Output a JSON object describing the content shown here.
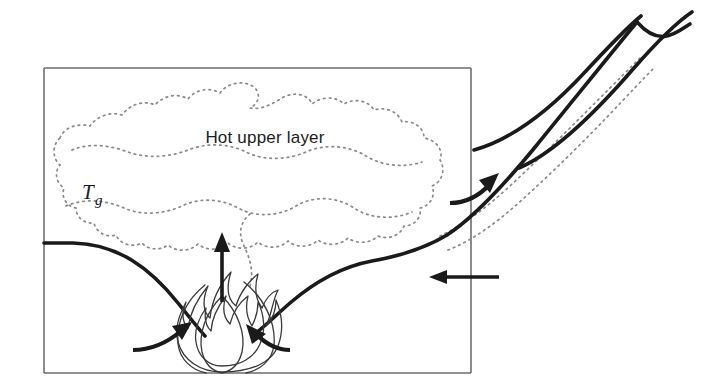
{
  "figure": {
    "background_color": "#ffffff",
    "width": 726,
    "height": 389
  },
  "labels": {
    "upper_layer": "Hot upper layer",
    "gas_temperature_symbol": "T",
    "gas_temperature_subscript": "g"
  },
  "colors": {
    "wall_stroke": "#6f6f6f",
    "interface_stroke": "#1a1a1a",
    "plume_stroke": "#1a1a1a",
    "smoke_boundary_stroke": "#8a8a8a",
    "flame_stroke": "#3a3a3a",
    "arrow_stroke": "#1a1a1a",
    "text_fill": "#1c1c1c"
  },
  "compartment": {
    "name": "compartment-enclosure",
    "left": 44,
    "top": 68,
    "right": 471,
    "bottom": 373,
    "wall_path": "M 44 68 L 471 68 M 471 68 L 471 373 M 471 373 L 44 373 M 44 373 L 44 68"
  },
  "layer_interface": {
    "left_branch_path": "M 44 243 L 73 243 C 118 244 150 268 178 303 C 190 318 198 328 205 336",
    "right_branch_path": "M 252 336 C 262 329 274 317 290 303 C 318 279 345 266 372 261 C 400 256 424 249 447 235 C 470 220 500 190 536 146 C 576 97 612 52 637 22"
  },
  "external_plume": {
    "upper_boundary_path": "M 474 150 C 510 140 548 112 585 72 C 612 43 630 25 641 16",
    "lower_boundary_path": "M 637 22 C 660 48 676 33 690 24",
    "outer_curve_path": "M 519 168 C 556 152 596 112 634 68 C 663 35 680 20 692 12"
  },
  "smoke_cloud": {
    "description": "dotted irregular boundary of hot smoke layer",
    "inner_path": "M 60 138 C 64 127 78 123 90 126 C 96 117 110 111 122 115 C 130 104 144 100 155 105 C 164 95 178 93 188 99 C 196 89 210 87 220 93 C 228 82 244 80 254 87 C 262 95 258 104 250 108 C 262 110 272 104 282 98 C 294 91 308 94 312 104 C 322 96 336 96 344 104 C 354 98 368 100 374 110 C 386 106 398 112 402 122 C 414 120 424 128 424 138 C 436 140 444 150 440 160 C 446 170 442 182 432 186 C 436 196 430 206 420 208 C 422 218 414 226 404 226 C 400 236 388 240 378 236 C 370 244 356 244 348 238 C 340 246 326 246 318 240 C 310 248 296 248 288 241 C 280 249 266 249 258 242 C 250 250 236 250 228 243 C 220 251 206 251 198 244 C 190 252 176 252 168 245 C 160 251 148 250 142 243 C 132 248 120 244 116 235 C 106 238 96 232 94 223 C 84 224 76 217 76 208 C 66 206 61 197 64 188 C 56 183 54 172 60 165 C 52 158 52 145 60 138 Z",
    "ripple_upper_path": "M 72 150 C 90 142 112 146 128 152 C 148 159 170 157 188 150 C 208 142 230 144 246 152 C 264 161 288 160 306 152 C 326 143 350 146 366 156 C 382 166 404 168 422 162",
    "ripple_lower_path": "M 66 206 C 84 198 106 200 124 208 C 142 216 164 214 182 206 C 200 197 222 199 238 208 C 256 218 280 216 296 206 C 314 195 338 197 354 208 C 370 219 394 220 412 212",
    "tail_path": "M 250 286 C 254 272 250 258 244 246 C 238 234 240 222 250 214",
    "vent_trail_upper_path": "M 440 236 C 462 226 486 208 510 186 C 540 158 570 128 596 102 C 616 82 632 66 642 56",
    "vent_trail_lower_path": "M 448 250 C 474 240 500 220 524 198 C 554 171 584 141 610 114 C 628 95 644 78 654 68"
  },
  "fire": {
    "name": "flame",
    "base_x": 222,
    "base_y": 373,
    "outer_flame_path": "M 222 372 C 200 372 183 360 178 342 C 174 327 180 314 186 302 C 182 312 182 322 188 328 C 190 312 198 298 208 286 C 202 300 203 312 210 318 C 212 300 220 284 231 272 C 226 288 228 300 236 306 C 240 292 250 280 258 274 C 254 288 256 300 262 308 C 266 298 272 292 278 290 C 272 302 272 314 266 326 C 272 320 276 310 276 300 C 282 314 284 330 278 346 C 272 362 252 372 222 372 Z",
    "inner_flame_path": "M 222 366 C 208 366 198 356 196 342 C 194 330 199 318 206 308 C 204 318 206 326 211 331 C 212 318 218 306 226 296 C 222 308 224 318 230 324 C 233 312 240 302 248 296 C 245 308 247 318 252 326 C 256 318 258 310 258 302 C 264 314 266 330 260 344 C 254 358 240 366 222 366 Z",
    "left_petal_path": "M 205 285 C 186 300 176 322 178 344 C 180 360 192 370 206 373",
    "right_petal_path": "M 244 282 C 264 298 276 322 274 345 C 272 361 260 370 246 373",
    "core_petal_path": "M 222 296 C 206 312 198 334 202 352 C 205 364 212 371 222 373 C 232 371 239 364 242 352 C 246 334 238 312 222 296 Z"
  },
  "arrows": [
    {
      "name": "plume-up-arrow",
      "kind": "straight-vertical",
      "direction": "up",
      "shaft_path": "M 222 302 L 222 244",
      "head_points": "222,232 214,252 230,252"
    },
    {
      "name": "air-inflow-left-arrow",
      "kind": "curved",
      "direction": "up-right",
      "shaft_path": "M 133 350 C 152 350 168 342 181 331",
      "head_points": "192,322 172,326 182,340"
    },
    {
      "name": "air-inflow-right-arrow",
      "kind": "curved",
      "direction": "up-left",
      "shaft_path": "M 290 350 C 278 350 266 344 256 334",
      "head_points": "246,324 252,344 266,334"
    },
    {
      "name": "vent-outflow-arrow",
      "kind": "curved",
      "direction": "up-right",
      "shaft_path": "M 450 203 C 466 203 480 195 490 184",
      "head_points": "499,173 479,180 490,193"
    },
    {
      "name": "vent-inflow-arrow",
      "kind": "straight-horizontal",
      "direction": "left",
      "shaft_path": "M 499 277 L 440 277",
      "head_points": "429,277 447,270 447,284"
    }
  ],
  "text_positions": {
    "upper_layer": {
      "x": 265,
      "y": 143,
      "anchor": "middle"
    },
    "gas_symbol": {
      "x": 82,
      "y": 199
    },
    "gas_subscript": {
      "x": 95,
      "y": 205
    }
  }
}
